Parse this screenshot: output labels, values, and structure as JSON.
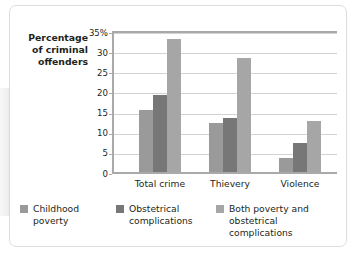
{
  "chart_data": {
    "type": "bar",
    "title": "",
    "subtitle": "",
    "ylabel": "Percentage of criminal offenders",
    "xlabel": "",
    "categories": [
      "Total crime",
      "Thievery",
      "Violence"
    ],
    "series": [
      {
        "name": "Childhood poverty",
        "values": [
          15.5,
          12.2,
          3.4
        ],
        "color": "#9a9a9a"
      },
      {
        "name": "Obstetrical complications",
        "values": [
          19.0,
          13.3,
          7.3
        ],
        "color": "#777777"
      },
      {
        "name": "Both poverty and obstetrical complications",
        "values": [
          33.0,
          28.3,
          12.7
        ],
        "color": "#a6a6a6"
      }
    ],
    "ylim": [
      0,
      35
    ],
    "yticks": [
      {
        "value": 35,
        "label": "35%"
      },
      {
        "value": 30,
        "label": "30"
      },
      {
        "value": 25,
        "label": "25"
      },
      {
        "value": 20,
        "label": "20"
      },
      {
        "value": 15,
        "label": "15"
      },
      {
        "value": 10,
        "label": "10"
      },
      {
        "value": 5,
        "label": "5"
      },
      {
        "value": 0,
        "label": "0"
      }
    ],
    "grid": true,
    "legend_position": "bottom"
  },
  "legend": {
    "items": [
      {
        "label": "Childhood\npoverty"
      },
      {
        "label": "Obstetrical\ncomplications"
      },
      {
        "label": "Both poverty and\nobstetrical complications"
      }
    ]
  },
  "axis_title": {
    "line1": "Percentage",
    "line2": "of criminal",
    "line3": "offenders"
  }
}
